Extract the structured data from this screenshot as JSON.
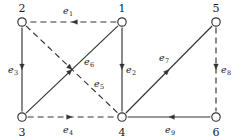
{
  "figure": {
    "type": "directed-graph",
    "width": 242,
    "height": 140,
    "background_color": "#ffffff",
    "stroke_color": "#333333",
    "node_fill_color": "#ffffff",
    "label_color": "#1a1a1a"
  },
  "nodes": [
    {
      "id": "1",
      "label": "1",
      "x": 122,
      "y": 22,
      "label_x": 122,
      "label_y": 8
    },
    {
      "id": "2",
      "label": "2",
      "x": 22,
      "y": 22,
      "label_x": 22,
      "label_y": 8
    },
    {
      "id": "3",
      "label": "3",
      "x": 22,
      "y": 117,
      "label_x": 22,
      "label_y": 132
    },
    {
      "id": "4",
      "label": "4",
      "x": 122,
      "y": 117,
      "label_x": 122,
      "label_y": 132
    },
    {
      "id": "5",
      "label": "5",
      "x": 216,
      "y": 22,
      "label_x": 216,
      "label_y": 8
    },
    {
      "id": "6",
      "label": "6",
      "x": 216,
      "y": 117,
      "label_x": 216,
      "label_y": 132
    }
  ],
  "edges": [
    {
      "id": "e1",
      "label": "e",
      "subscript": "1",
      "from": "1",
      "to": "2",
      "style": "dashed",
      "direction": "left",
      "label_x": 68,
      "label_y": 11
    },
    {
      "id": "e2",
      "label": "e",
      "subscript": "2",
      "from": "1",
      "to": "4",
      "style": "solid",
      "direction": "down",
      "label_x": 131,
      "label_y": 70
    },
    {
      "id": "e3",
      "label": "e",
      "subscript": "3",
      "from": "2",
      "to": "3",
      "style": "solid",
      "direction": "down",
      "label_x": 13,
      "label_y": 70
    },
    {
      "id": "e4",
      "label": "e",
      "subscript": "4",
      "from": "3",
      "to": "4",
      "style": "dashed",
      "direction": "right",
      "label_x": 68,
      "label_y": 130
    },
    {
      "id": "e5",
      "label": "e",
      "subscript": "5",
      "from": "2",
      "to": "4",
      "style": "dashed",
      "direction": "down-right",
      "label_x": 99,
      "label_y": 84
    },
    {
      "id": "e6",
      "label": "e",
      "subscript": "6",
      "from": "3",
      "to": "1",
      "style": "solid",
      "direction": "up-right",
      "label_x": 89,
      "label_y": 62
    },
    {
      "id": "e7",
      "label": "e",
      "subscript": "7",
      "from": "4",
      "to": "5",
      "style": "solid",
      "direction": "up-right",
      "label_x": 164,
      "label_y": 58
    },
    {
      "id": "e8",
      "label": "e",
      "subscript": "8",
      "from": "5",
      "to": "6",
      "style": "dashed",
      "direction": "down",
      "label_x": 226,
      "label_y": 70
    },
    {
      "id": "e9",
      "label": "e",
      "subscript": "9",
      "from": "6",
      "to": "4",
      "style": "solid",
      "direction": "left",
      "label_x": 170,
      "label_y": 130
    }
  ],
  "chart_data": {
    "type": "diagram",
    "title": "",
    "vertices": [
      "1",
      "2",
      "3",
      "4",
      "5",
      "6"
    ],
    "edge_list": [
      {
        "name": "e1",
        "source": "1",
        "target": "2",
        "line": "dashed"
      },
      {
        "name": "e2",
        "source": "1",
        "target": "4",
        "line": "solid"
      },
      {
        "name": "e3",
        "source": "2",
        "target": "3",
        "line": "solid"
      },
      {
        "name": "e4",
        "source": "3",
        "target": "4",
        "line": "dashed"
      },
      {
        "name": "e5",
        "source": "2",
        "target": "4",
        "line": "dashed"
      },
      {
        "name": "e6",
        "source": "3",
        "target": "1",
        "line": "solid"
      },
      {
        "name": "e7",
        "source": "4",
        "target": "5",
        "line": "solid"
      },
      {
        "name": "e8",
        "source": "5",
        "target": "6",
        "line": "dashed"
      },
      {
        "name": "e9",
        "source": "6",
        "target": "4",
        "line": "solid"
      }
    ]
  }
}
